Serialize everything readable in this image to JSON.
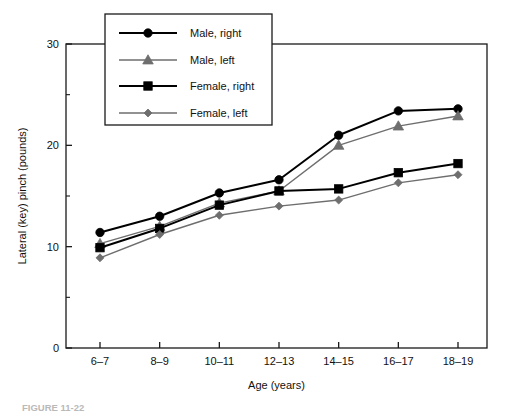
{
  "chart_data": {
    "type": "line",
    "title": "",
    "xlabel": "Age (years)",
    "ylabel": "Lateral (key) pinch (pounds)",
    "categories": [
      "6–7",
      "8–9",
      "10–11",
      "12–13",
      "14–15",
      "16–17",
      "18–19"
    ],
    "ylim": [
      0,
      30
    ],
    "yticks": [
      0,
      10,
      20,
      30
    ],
    "ytick_labels": [
      "0",
      "10",
      "20",
      "30"
    ],
    "yminor_ticks": [
      5,
      15,
      25
    ],
    "grid": false,
    "legend_position": "upper-left",
    "series": [
      {
        "name": "Male, right",
        "marker": "circle",
        "color": "#000000",
        "line_width": 2,
        "values": [
          11.4,
          13.0,
          15.3,
          16.6,
          21.0,
          23.4,
          23.6
        ]
      },
      {
        "name": "Male, left",
        "marker": "triangle",
        "color": "#6e6e6e",
        "line_width": 1.4,
        "values": [
          10.3,
          12.0,
          14.3,
          15.5,
          20.0,
          21.9,
          22.9
        ]
      },
      {
        "name": "Female, right",
        "marker": "square",
        "color": "#000000",
        "line_width": 2,
        "values": [
          9.9,
          11.8,
          14.1,
          15.5,
          15.7,
          17.3,
          18.2
        ]
      },
      {
        "name": "Female, left",
        "marker": "diamond",
        "color": "#6e6e6e",
        "line_width": 1.4,
        "values": [
          8.9,
          11.2,
          13.1,
          14.0,
          14.6,
          16.3,
          17.1
        ]
      }
    ]
  },
  "axes": {
    "x_axis_title": "Age (years)",
    "y_axis_title": "Lateral (key) pinch (pounds)"
  },
  "legend": {
    "entries": [
      {
        "label": "Male, right"
      },
      {
        "label": "Male, left"
      },
      {
        "label": "Female, right"
      },
      {
        "label": "Female, left"
      }
    ]
  },
  "caption": {
    "text": "FIGURE 11-22"
  }
}
